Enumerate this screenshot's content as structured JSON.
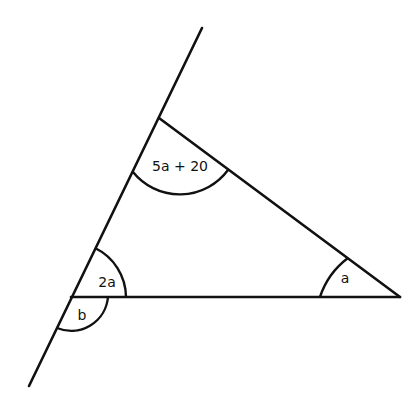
{
  "diagram": {
    "labels": {
      "top_angle": "5a + 20",
      "left_interior_angle": "2a",
      "right_angle": "a",
      "exterior_angle": "b"
    },
    "vertices": {
      "top": [
        159,
        118
      ],
      "left": [
        71,
        297
      ],
      "right": [
        400,
        297
      ]
    },
    "extended_line": {
      "start": [
        202,
        28
      ],
      "end": [
        29,
        386
      ]
    },
    "colors": {
      "stroke": "#111111",
      "background": "#ffffff"
    }
  }
}
